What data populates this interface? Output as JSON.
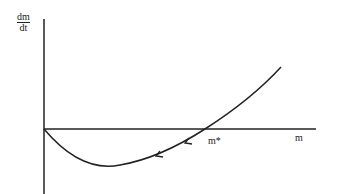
{
  "diagram": {
    "type": "phase-line plot",
    "y_axis_label": {
      "numerator": "dm",
      "denominator": "dt"
    },
    "x_axis_label": "m",
    "equilibrium_label": "m*",
    "curve": "U-shaped curve starting at origin, dipping below the m-axis, crossing at m* and rising",
    "arrows": "two arrowheads on the curve pointing left/down toward the origin side"
  },
  "colors": {
    "line": "#222222",
    "background": "#ffffff"
  }
}
